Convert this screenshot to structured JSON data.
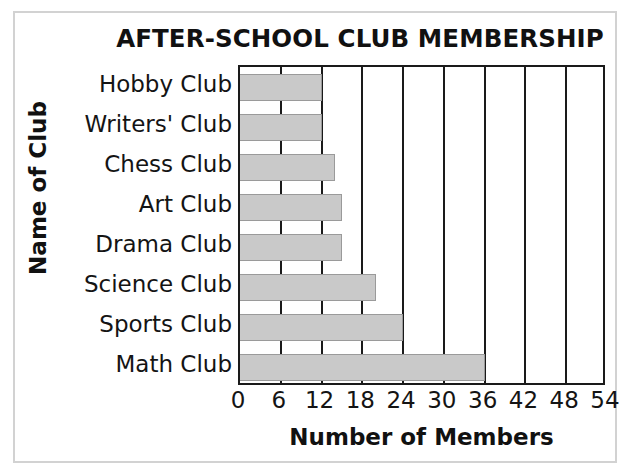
{
  "chart_data": {
    "type": "bar",
    "orientation": "horizontal",
    "title": "AFTER-SCHOOL CLUB MEMBERSHIP",
    "xlabel": "Number of Members",
    "ylabel": "Name of Club",
    "categories": [
      "Hobby Club",
      "Writers' Club",
      "Chess Club",
      "Art Club",
      "Drama Club",
      "Science Club",
      "Sports Club",
      "Math Club"
    ],
    "values": [
      12,
      12,
      14,
      15,
      15,
      20,
      24,
      36
    ],
    "xticks": [
      0,
      6,
      12,
      18,
      24,
      30,
      36,
      42,
      48,
      54
    ],
    "xlim": [
      0,
      54
    ],
    "grid": "vertical",
    "legend": null,
    "bar_color": "#c9c9c9",
    "axis_color": "#1a1a1a",
    "text_color": "#141414",
    "frame_color": "#d2d2d2"
  }
}
